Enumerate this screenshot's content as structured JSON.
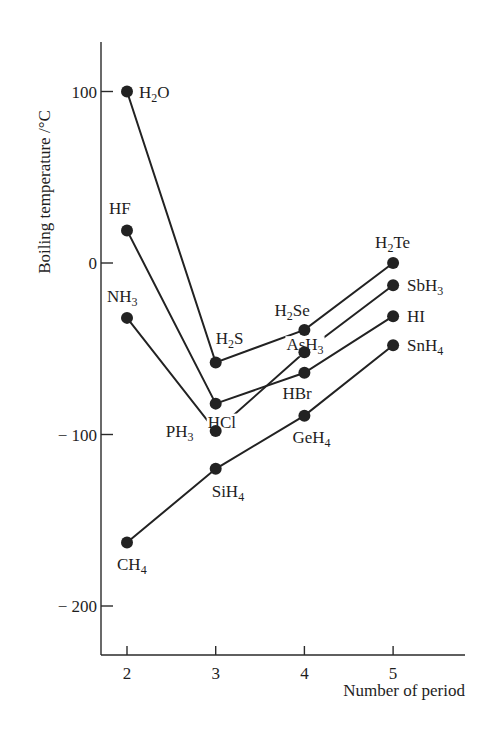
{
  "chart_data": {
    "type": "line",
    "title": "",
    "xlabel": "Number of period",
    "ylabel": "Boiling temperature /°C",
    "x": [
      2,
      3,
      4,
      5
    ],
    "xticks": [
      "2",
      "3",
      "4",
      "5"
    ],
    "yticks": [
      100,
      0,
      -100,
      -200
    ],
    "ytick_labels": [
      "100",
      "0",
      "− 100",
      "− 200"
    ],
    "ylim": [
      -230,
      130
    ],
    "grid": false,
    "legend": "none (points labelled directly)",
    "series": [
      {
        "name": "Group 16 hydrides",
        "labels": [
          [
            "H",
            "2",
            "O"
          ],
          [
            "H",
            "2",
            "S"
          ],
          [
            "H",
            "2",
            "Se"
          ],
          [
            "H",
            "2",
            "Te"
          ]
        ],
        "values": [
          100,
          -58,
          -39,
          0
        ]
      },
      {
        "name": "Group 17 hydrides",
        "labels": [
          [
            "HF"
          ],
          [
            "HCl"
          ],
          [
            "HBr"
          ],
          [
            "HI"
          ]
        ],
        "values": [
          19,
          -82,
          -64,
          -31
        ]
      },
      {
        "name": "Group 15 hydrides",
        "labels": [
          [
            "NH",
            "3",
            ""
          ],
          [
            "PH",
            "3",
            ""
          ],
          [
            "AsH",
            "3",
            ""
          ],
          [
            "SbH",
            "3",
            ""
          ]
        ],
        "values": [
          -32,
          -98,
          -52,
          -13
        ]
      },
      {
        "name": "Group 14 hydrides",
        "labels": [
          [
            "CH",
            "4",
            ""
          ],
          [
            "SiH",
            "4",
            ""
          ],
          [
            "GeH",
            "4",
            ""
          ],
          [
            "SnH",
            "4",
            ""
          ]
        ],
        "values": [
          -163,
          -120,
          -89,
          -48
        ]
      }
    ]
  },
  "layout": {
    "x_origin_px": 127,
    "x_step_px": 88.7,
    "y_zero_px": 263,
    "y_px_per_degree": 1.715,
    "axis_x_px": 101,
    "axis_top_px": 42,
    "axis_bottom_px": 655,
    "axis_right_px": 465,
    "label_offsets": [
      [
        [
          12,
          6
        ],
        [
          0,
          -18
        ],
        [
          -30,
          -14
        ],
        [
          -18,
          -15
        ]
      ],
      [
        [
          -18,
          -16
        ],
        [
          -8,
          24
        ],
        [
          -22,
          26
        ],
        [
          14,
          6
        ]
      ],
      [
        [
          -20,
          -16
        ],
        [
          -50,
          6
        ],
        [
          -18,
          -2
        ],
        [
          14,
          6
        ]
      ],
      [
        [
          -10,
          27
        ],
        [
          -4,
          28
        ],
        [
          -12,
          27
        ],
        [
          14,
          6
        ]
      ]
    ]
  }
}
